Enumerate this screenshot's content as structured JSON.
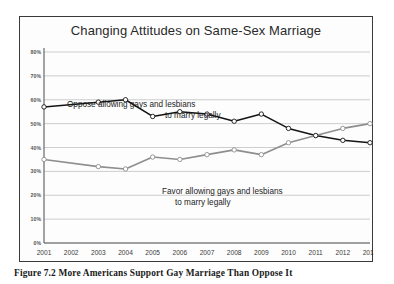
{
  "figure": {
    "caption": "Figure 7.2  More Americans Support Gay Marriage Than Oppose It"
  },
  "chart_data": {
    "type": "line",
    "title": "Changing Attitudes on Same-Sex Marriage",
    "xlabel": "",
    "ylabel": "",
    "ylim": [
      0,
      80
    ],
    "ytick_labels": [
      "0%",
      "10%",
      "20%",
      "30%",
      "40%",
      "50%",
      "60%",
      "70%",
      "80%"
    ],
    "ytick_values": [
      0,
      10,
      20,
      30,
      40,
      50,
      60,
      70,
      80
    ],
    "grid": true,
    "legend_position": "inline-annotation",
    "categories": [
      "2001",
      "2002",
      "2003",
      "2004",
      "2005",
      "2006",
      "2007",
      "2008",
      "2009",
      "2010",
      "2011",
      "2012",
      "2013"
    ],
    "series": [
      {
        "name": "Oppose allowing gays and lesbians to marry legally",
        "color": "#141414",
        "values": [
          57,
          null,
          59,
          60,
          53,
          55,
          54,
          51,
          54,
          48,
          45,
          43,
          42
        ]
      },
      {
        "name": "Favor allowing gays and lesbians to marry legally",
        "color": "#8e8e8e",
        "values": [
          35,
          null,
          32,
          31,
          36,
          35,
          37,
          39,
          37,
          42,
          45,
          48,
          50
        ]
      }
    ],
    "annotations": [
      {
        "id": "oppose-label",
        "line1": "Oppose allowing gays and lesbians",
        "line2": "to marry legally"
      },
      {
        "id": "favor-label",
        "line1": "Favor allowing gays and lesbians",
        "line2": "to marry legally"
      }
    ]
  }
}
